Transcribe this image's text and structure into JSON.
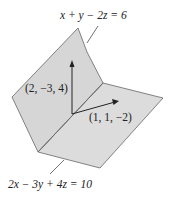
{
  "figure": {
    "plane_top_label": "x + y − 2z = 6",
    "plane_bottom_label": "2x − 3y + 4z = 10",
    "normal_vertical_label": "(2, −3, 4)",
    "normal_horizontal_label": "(1, 1, −2)",
    "colors": {
      "plane_fill": "#d9d9d9",
      "edge": "#555555",
      "arrow": "#222222"
    }
  }
}
